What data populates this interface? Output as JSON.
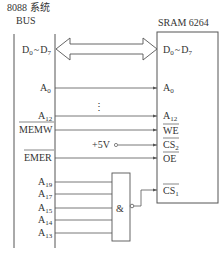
{
  "header": {
    "bus_title_line1": "8088 系统",
    "bus_title_line2": "BUS",
    "sram_title": "SRAM 6264"
  },
  "data_bus": {
    "left_label": "D",
    "left_label_from": "0",
    "tilde": "~",
    "left_label_to_base": "D",
    "left_label_to": "7",
    "right_label": "D",
    "right_label_from": "0",
    "right_label_to_base": "D",
    "right_label_to": "7"
  },
  "address_lines": {
    "a0_base": "A",
    "a0_sub": "0",
    "a12_base": "A",
    "a12_sub": "12",
    "ellipsis": "⋮"
  },
  "control_lines": {
    "memw": "MEMW",
    "emer": "EMER",
    "vcc": "+5V",
    "we": "WE",
    "cs2_base": "CS",
    "cs2_sub": "2",
    "oe": "OE",
    "cs1_base": "CS",
    "cs1_sub": "1"
  },
  "decoder_inputs": [
    {
      "base": "A",
      "sub": "19"
    },
    {
      "base": "A",
      "sub": "17"
    },
    {
      "base": "A",
      "sub": "15"
    },
    {
      "base": "A",
      "sub": "14"
    },
    {
      "base": "A",
      "sub": "13"
    }
  ],
  "gate": {
    "symbol": "&"
  },
  "colors": {
    "stroke": "#555555",
    "text": "#333333"
  }
}
